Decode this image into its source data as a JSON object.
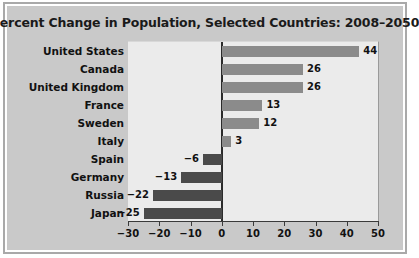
{
  "chart_data": {
    "type": "bar",
    "orientation": "horizontal",
    "title": "Percent Change in Population, Selected Countries: 2008–2050",
    "xlabel": "",
    "ylabel": "",
    "categories": [
      "United States",
      "Canada",
      "United Kingdom",
      "France",
      "Sweden",
      "Italy",
      "Spain",
      "Germany",
      "Russia",
      "Japan"
    ],
    "values": [
      44,
      26,
      26,
      13,
      12,
      3,
      -6,
      -13,
      -22,
      -25
    ],
    "value_labels": [
      "44",
      "26",
      "26",
      "13",
      "12",
      "3",
      "−6",
      "−13",
      "−22",
      "−25"
    ],
    "xlim": [
      -30,
      50
    ],
    "xticks": [
      -30,
      -20,
      -10,
      0,
      10,
      20,
      30,
      40,
      50
    ],
    "xtick_labels": [
      "−30",
      "−20",
      "−10",
      "0",
      "10",
      "20",
      "30",
      "40",
      "50"
    ],
    "grid": false,
    "legend": false,
    "colors": {
      "positive_bar": "#8b8b8b",
      "negative_bar": "#4a4a4a",
      "plot_background": "#ebebeb",
      "figure_background": "#c9c9c9",
      "zero_line": "#2b2b2b",
      "text": "#111111",
      "frame_border": "#a9a9a9"
    }
  }
}
